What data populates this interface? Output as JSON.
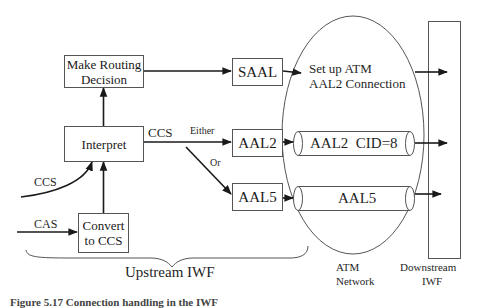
{
  "diagram": {
    "blocks": {
      "routing": {
        "line1": "Make Routing",
        "line2": "Decision"
      },
      "interpret": {
        "label": "Interpret"
      },
      "convert": {
        "line1": "Convert",
        "line2": "to CCS"
      },
      "saal": {
        "label": "SAAL"
      },
      "aal2": {
        "label": "AAL2"
      },
      "aal5": {
        "label": "AAL5"
      },
      "downstream": {
        "line1": "Downstream",
        "line2": "IWF"
      }
    },
    "connections": {
      "aal2_pipe": "AAL2  CID=8",
      "aal5_pipe": "AAL5",
      "setup_line1": "Set up ATM",
      "setup_line2": "AAL2 Connection"
    },
    "labels": {
      "ccs_out": "CCS",
      "either": "Either",
      "or": "Or",
      "ccs_in": "CCS",
      "cas_in": "CAS",
      "upstream": "Upstream IWF",
      "atm_line1": "ATM",
      "atm_line2": "Network"
    },
    "caption": "Figure 5.17  Connection handling in the IWF"
  },
  "colors": {
    "stroke": "#1a1a1a",
    "thin_stroke": "#555555",
    "background": "#ffffff"
  }
}
